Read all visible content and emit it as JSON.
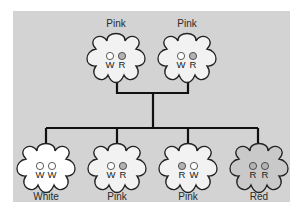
{
  "diagram": {
    "title": "",
    "colors": {
      "panel": "#d3d3d3",
      "line": "#111111",
      "outline": "#222222",
      "white_fill": "#ffffff",
      "pink_fill": "#f2f2f2",
      "red_fill": "#c9c9c9",
      "W_dot": "#ffffff",
      "R_dot": "#b3b3b3"
    },
    "parents": [
      {
        "label": "Pink",
        "alleles": [
          "W",
          "R"
        ],
        "phenotype": "pink"
      },
      {
        "label": "Pink",
        "alleles": [
          "W",
          "R"
        ],
        "phenotype": "pink"
      }
    ],
    "offspring": [
      {
        "label": "White",
        "alleles": [
          "W",
          "W"
        ],
        "phenotype": "white"
      },
      {
        "label": "Pink",
        "alleles": [
          "W",
          "R"
        ],
        "phenotype": "pink"
      },
      {
        "label": "Pink",
        "alleles": [
          "R",
          "W"
        ],
        "phenotype": "pink"
      },
      {
        "label": "Red",
        "alleles": [
          "R",
          "R"
        ],
        "phenotype": "red"
      }
    ]
  }
}
